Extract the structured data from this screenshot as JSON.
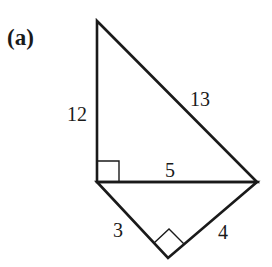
{
  "figure": {
    "label": "(a)",
    "vertices": {
      "top": [
        97,
        21
      ],
      "left": [
        97,
        182
      ],
      "right": [
        257,
        182
      ],
      "bottom": [
        168,
        258
      ]
    },
    "side_labels": {
      "vertical": "12",
      "hypotenuse_upper": "13",
      "shared_side": "5",
      "lower_left": "3",
      "lower_right": "4"
    },
    "stroke_color": "#1a1a1a"
  }
}
